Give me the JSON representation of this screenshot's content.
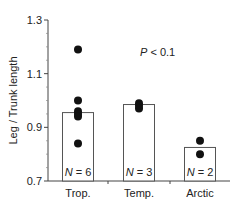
{
  "chart_data": {
    "type": "bar",
    "title": "",
    "xlabel": "",
    "ylabel": "Leg / Trunk length",
    "ylim": [
      0.7,
      1.3
    ],
    "yticks": [
      0.7,
      0.9,
      1.1,
      1.3
    ],
    "ytick_labels": [
      "0.7",
      "0.9",
      "1.1",
      "1.3"
    ],
    "grid": false,
    "categories": [
      "Trop.",
      "Temp.",
      "Arctic"
    ],
    "values": [
      0.955,
      0.985,
      0.825
    ],
    "sample_sizes": [
      "N = 6",
      "N = 3",
      "N = 2"
    ],
    "points": [
      [
        1.19,
        1.0,
        0.96,
        0.95,
        0.94,
        0.84
      ],
      [
        0.99,
        0.98,
        0.97
      ],
      [
        0.85,
        0.8
      ]
    ],
    "annotations": [
      "P < 0.1"
    ]
  },
  "labels": {
    "ylabel": "Leg / Trunk length",
    "pvalue_italic": "P",
    "pvalue_rest": " < 0.1",
    "n_italic": "N"
  }
}
